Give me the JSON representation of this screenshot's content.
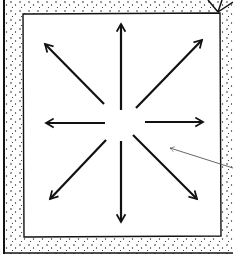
{
  "diagram": {
    "colors": {
      "background": "#ffffff",
      "ink": "#111111",
      "stipple": "#222222",
      "pointer": "#555555"
    },
    "center": [
      121,
      122
    ],
    "arrows": [
      {
        "direction": "up"
      },
      {
        "direction": "up-right"
      },
      {
        "direction": "right"
      },
      {
        "direction": "down-right"
      },
      {
        "direction": "down"
      },
      {
        "direction": "down-left"
      },
      {
        "direction": "left"
      },
      {
        "direction": "up-left"
      }
    ],
    "pointer_line": {
      "from": "right-edge",
      "to": [
        170,
        148
      ]
    }
  }
}
